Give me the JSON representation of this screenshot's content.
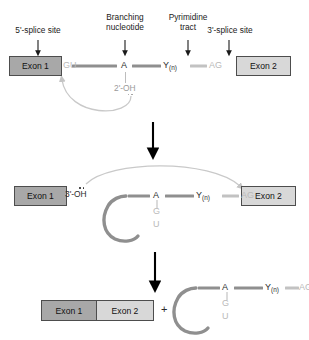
{
  "diagram": {
    "colors": {
      "exon_dark": "#a8a8a8",
      "exon_light": "#d8d8d8",
      "intron_bar": "#8f8f8f",
      "intron_bar_light": "#c2c2c2",
      "nucleotide_dark": "#2b2b2b",
      "nucleotide_gray": "#b9b9b9",
      "arrow_black": "#000000",
      "arrow_gray": "#c4c4c4",
      "text": "#1a1a1a"
    },
    "callout_labels": [
      {
        "id": "five-prime-splice-site",
        "line1": "5'-splice site",
        "line2": ""
      },
      {
        "id": "branching-nucleotide",
        "line1": "Branching",
        "line2": "nucleotide"
      },
      {
        "id": "pyrimidine-tract",
        "line1": "Pyrimidine",
        "line2": "tract"
      },
      {
        "id": "three-prime-splice-site",
        "line1": "3'-splice site",
        "line2": ""
      }
    ],
    "stage1": {
      "exon_left": "Exon 1",
      "exon_right": "Exon 2",
      "five_prime_dinucleotide": "GU",
      "branch_nucleotide": "A",
      "pyrimidine": "Y",
      "pyrimidine_subscript": "(n)",
      "three_prime_dinucleotide": "AG",
      "hydroxyl_label": "2'-OH"
    },
    "stage2": {
      "exon_left": "Exon 1",
      "exon_right": "Exon 2",
      "hydroxyl_label": "3'-OH",
      "branch_nucleotide": "A",
      "loop_letters": [
        "G",
        "U"
      ],
      "pyrimidine": "Y",
      "pyrimidine_subscript": "(n)",
      "three_prime_dinucleotide": "AG"
    },
    "stage3": {
      "exon_left": "Exon 1",
      "exon_right": "Exon 2",
      "plus_sign": "+",
      "branch_nucleotide": "A",
      "loop_letters": [
        "G",
        "U"
      ],
      "pyrimidine": "Y",
      "pyrimidine_subscript": "(n)",
      "three_prime_dinucleotide": "AG"
    }
  }
}
